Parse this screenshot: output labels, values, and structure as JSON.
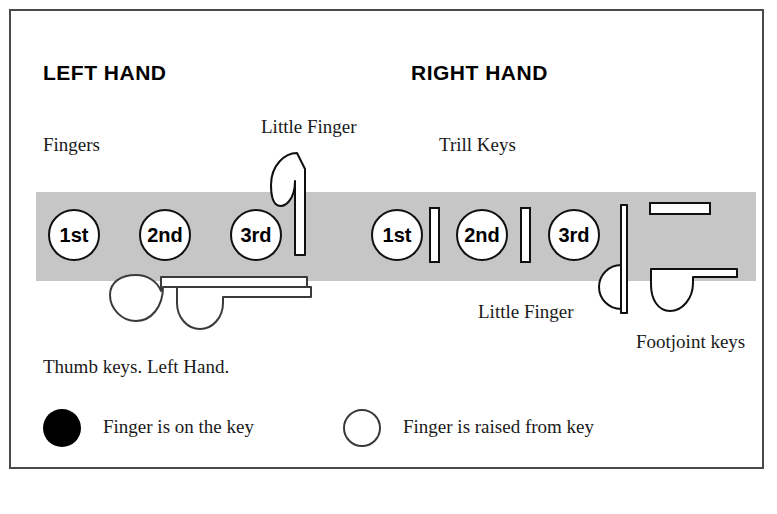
{
  "diagram": {
    "title_left": "LEFT HAND",
    "title_right": "RIGHT HAND",
    "bar_color": "#c6c6c6",
    "outline_color": "#101010"
  },
  "labels": {
    "fingers": "Fingers",
    "little_finger_left": "Little Finger",
    "trill_keys": "Trill Keys",
    "little_finger_right": "Little Finger",
    "footjoint_keys": "Footjoint\nkeys",
    "thumb_keys": "Thumb keys. Left Hand."
  },
  "left_hand": {
    "keys": [
      {
        "label": "1st"
      },
      {
        "label": "2nd"
      },
      {
        "label": "3rd"
      }
    ]
  },
  "right_hand": {
    "keys": [
      {
        "label": "1st"
      },
      {
        "label": "2nd"
      },
      {
        "label": "3rd"
      }
    ],
    "trill_keys_count": 2
  },
  "legend": {
    "items": [
      {
        "marker": "filled-circle",
        "text": "Finger is on the key"
      },
      {
        "marker": "open-circle",
        "text": "Finger is raised from key"
      }
    ]
  }
}
